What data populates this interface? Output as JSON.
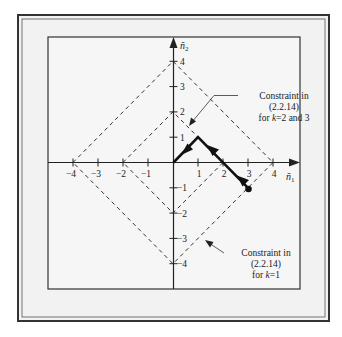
{
  "figure": {
    "axes": {
      "x_label": "ñ",
      "x_sub": "1",
      "y_label": "ñ",
      "y_sub": "2",
      "x_ticks": [
        "-4",
        "-3",
        "-2",
        "-1",
        "1",
        "2",
        "3",
        "4"
      ],
      "y_ticks": [
        "4",
        "3",
        "2",
        "1",
        "-1",
        "-2",
        "-3",
        "-4"
      ]
    },
    "annotations": [
      {
        "line1": "Constraint in",
        "line2": "(2.2.14)",
        "line3_prefix": "for ",
        "line3_var": "k",
        "line3_suffix": "=2 and 3"
      },
      {
        "line1": "Constraint in",
        "line2": "(2.2.14)",
        "line3_prefix": "for ",
        "line3_var": "k",
        "line3_suffix": "=1"
      }
    ],
    "path": {
      "points": [
        [
          3,
          -1
        ],
        [
          1,
          1
        ],
        [
          0,
          0
        ]
      ],
      "start_marker": "dot"
    },
    "diamonds": [
      {
        "radius": 4,
        "style": "dashed"
      },
      {
        "radius": 2,
        "style": "dashed"
      }
    ],
    "colors": {
      "frame_bg": "#f2f2f2",
      "ink": "#222222"
    }
  }
}
